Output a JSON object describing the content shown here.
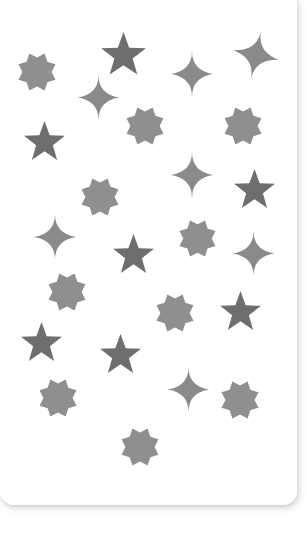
{
  "canvas": {
    "width": 307,
    "height": 537,
    "background_color": "#ffffff"
  },
  "card": {
    "name": "star-pattern-card",
    "background_color": "#ffffff",
    "left": 0,
    "top": -6,
    "width": 297,
    "height": 511,
    "corner_radius_bottom": 14,
    "corner_radius_top_right": 10,
    "shadow_color": "#787880"
  },
  "palette": {
    "octagram": "#8f8f8f",
    "five_point_star": "#6e6e6e",
    "sparkle": "#8a8a8a"
  },
  "legend": [
    {
      "type": "octagram",
      "label": "8-pointed star",
      "color": "#8f8f8f",
      "count": 11
    },
    {
      "type": "five_point_star",
      "label": "5-pointed star",
      "color": "#6e6e6e",
      "count": 7
    },
    {
      "type": "sparkle",
      "label": "4-pointed sparkle",
      "color": "#8a8a8a",
      "count": 7
    }
  ],
  "shapes": [
    {
      "id": "octagram-1",
      "type": "octagram",
      "cx": 37,
      "cy": 72,
      "size": 40,
      "rotation": 0,
      "color": "#8f8f8f"
    },
    {
      "id": "star5-1",
      "type": "five_point_star",
      "cx": 123,
      "cy": 55,
      "size": 47,
      "rotation": 0,
      "color": "#6e6e6e"
    },
    {
      "id": "sparkle-1",
      "type": "sparkle",
      "cx": 192,
      "cy": 74,
      "size": 46,
      "rotation": 0,
      "color": "#8a8a8a"
    },
    {
      "id": "sparkle-2",
      "type": "sparkle",
      "cx": 256,
      "cy": 55,
      "size": 50,
      "rotation": 12,
      "color": "#8a8a8a"
    },
    {
      "id": "sparkle-3",
      "type": "sparkle",
      "cx": 98,
      "cy": 97,
      "size": 45,
      "rotation": 0,
      "color": "#8a8a8a"
    },
    {
      "id": "octagram-2",
      "type": "octagram",
      "cx": 145,
      "cy": 126,
      "size": 40,
      "rotation": 0,
      "color": "#8f8f8f"
    },
    {
      "id": "octagram-3",
      "type": "octagram",
      "cx": 243,
      "cy": 126,
      "size": 40,
      "rotation": 0,
      "color": "#8f8f8f"
    },
    {
      "id": "star5-2",
      "type": "five_point_star",
      "cx": 44,
      "cy": 142,
      "size": 43,
      "rotation": 0,
      "color": "#6e6e6e"
    },
    {
      "id": "sparkle-4",
      "type": "sparkle",
      "cx": 192,
      "cy": 175,
      "size": 46,
      "rotation": 0,
      "color": "#8a8a8a"
    },
    {
      "id": "star5-3",
      "type": "five_point_star",
      "cx": 254,
      "cy": 190,
      "size": 43,
      "rotation": 0,
      "color": "#6e6e6e"
    },
    {
      "id": "octagram-4",
      "type": "octagram",
      "cx": 100,
      "cy": 197,
      "size": 40,
      "rotation": 0,
      "color": "#8f8f8f"
    },
    {
      "id": "sparkle-5",
      "type": "sparkle",
      "cx": 55,
      "cy": 237,
      "size": 46,
      "rotation": 0,
      "color": "#8a8a8a"
    },
    {
      "id": "octagram-5",
      "type": "octagram",
      "cx": 197,
      "cy": 238,
      "size": 39,
      "rotation": 0,
      "color": "#8f8f8f"
    },
    {
      "id": "sparkle-6",
      "type": "sparkle",
      "cx": 253,
      "cy": 253,
      "size": 45,
      "rotation": 0,
      "color": "#8a8a8a"
    },
    {
      "id": "star5-4",
      "type": "five_point_star",
      "cx": 133,
      "cy": 255,
      "size": 43,
      "rotation": 0,
      "color": "#6e6e6e"
    },
    {
      "id": "octagram-6",
      "type": "octagram",
      "cx": 67,
      "cy": 292,
      "size": 40,
      "rotation": 0,
      "color": "#8f8f8f"
    },
    {
      "id": "octagram-7",
      "type": "octagram",
      "cx": 175,
      "cy": 313,
      "size": 40,
      "rotation": 0,
      "color": "#8f8f8f"
    },
    {
      "id": "star5-5",
      "type": "five_point_star",
      "cx": 240,
      "cy": 312,
      "size": 43,
      "rotation": 0,
      "color": "#6e6e6e"
    },
    {
      "id": "star5-6",
      "type": "five_point_star",
      "cx": 41,
      "cy": 343,
      "size": 43,
      "rotation": 0,
      "color": "#6e6e6e"
    },
    {
      "id": "star5-7",
      "type": "five_point_star",
      "cx": 120,
      "cy": 355,
      "size": 43,
      "rotation": 0,
      "color": "#6e6e6e"
    },
    {
      "id": "sparkle-7",
      "type": "sparkle",
      "cx": 188,
      "cy": 389,
      "size": 45,
      "rotation": 0,
      "color": "#8a8a8a"
    },
    {
      "id": "octagram-8",
      "type": "octagram",
      "cx": 58,
      "cy": 398,
      "size": 40,
      "rotation": 0,
      "color": "#8f8f8f"
    },
    {
      "id": "octagram-9",
      "type": "octagram",
      "cx": 240,
      "cy": 400,
      "size": 40,
      "rotation": 0,
      "color": "#8f8f8f"
    },
    {
      "id": "octagram-10",
      "type": "octagram",
      "cx": 140,
      "cy": 447,
      "size": 40,
      "rotation": 0,
      "color": "#8f8f8f"
    }
  ]
}
